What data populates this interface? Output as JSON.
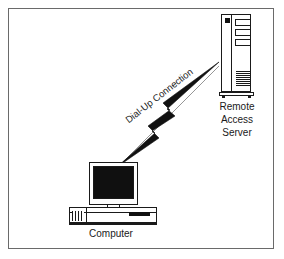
{
  "diagram": {
    "background_color": "#ffffff",
    "border_color": "#6a6a6a",
    "ink_color": "#1a1a1a",
    "nodes": {
      "server": {
        "label_lines": [
          "Remote",
          "Access",
          "Server"
        ],
        "icon": "tower-server-icon",
        "drive_bays": 3,
        "status_led": "power-led"
      },
      "computer": {
        "label": "Computer",
        "icon": "desktop-computer-icon",
        "screen_color": "#101010"
      }
    },
    "connection": {
      "label": "Dial-Up Connection",
      "style": "lightning-bolt",
      "color": "#111111",
      "from": "Computer",
      "to": "Remote Access Server"
    }
  }
}
